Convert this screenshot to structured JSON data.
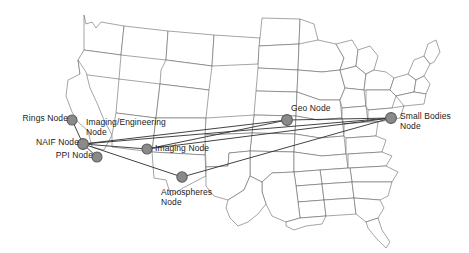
{
  "diagram": {
    "map_region": "United States",
    "line_color": "#2e2e2e",
    "node_fill": "#8a8a8a",
    "node_stroke": "#5d5d5d",
    "state_stroke": "#5a5a5a",
    "background": "#ffffff"
  },
  "nodes": [
    {
      "id": "rings",
      "label": "Rings Node",
      "label_line1": "Rings Node",
      "label_line2": "",
      "x": 72,
      "y": 120,
      "r": 5.0,
      "label_x": 14,
      "label_y": 114,
      "align": "right",
      "label_w": 54
    },
    {
      "id": "naif",
      "label": "NAIF Node",
      "label_line1": "NAIF Node",
      "label_line2": "",
      "x": 83,
      "y": 144,
      "r": 5.4,
      "label_x": 27,
      "label_y": 138,
      "align": "right",
      "label_w": 52
    },
    {
      "id": "ppi",
      "label": "PPI Node",
      "label_line1": "PPI Node",
      "label_line2": "",
      "x": 97,
      "y": 157,
      "r": 5.0,
      "label_x": 47,
      "label_y": 151,
      "align": "right",
      "label_w": 46
    },
    {
      "id": "imgeng",
      "label": "Imaging/Engineering Node",
      "label_line1": "Imaging/Engineering",
      "label_line2": "Node",
      "x": 83,
      "y": 144,
      "r": 0.0,
      "label_x": 86,
      "label_y": 118,
      "align": "left",
      "label_w": 88
    },
    {
      "id": "imaging",
      "label": "Imaging Node",
      "label_line1": "Imaging Node",
      "label_line2": "",
      "x": 147,
      "y": 149,
      "r": 5.0,
      "label_x": 155,
      "label_y": 144,
      "align": "left",
      "label_w": 62
    },
    {
      "id": "atmos",
      "label": "Atmospheres Node",
      "label_line1": "Atmospheres",
      "label_line2": "Node",
      "x": 182,
      "y": 177,
      "r": 5.2,
      "label_x": 161,
      "label_y": 188,
      "align": "left",
      "label_w": 60
    },
    {
      "id": "geo",
      "label": "Geo Node",
      "label_line1": "Geo Node",
      "label_line2": "",
      "x": 287,
      "y": 120,
      "r": 5.4,
      "label_x": 291,
      "label_y": 104,
      "align": "left",
      "label_w": 46
    },
    {
      "id": "smbodies",
      "label": "Small Bodies Node",
      "label_line1": "Small Bodies",
      "label_line2": "Node",
      "x": 391,
      "y": 118,
      "r": 5.4,
      "label_x": 400,
      "label_y": 112,
      "align": "left",
      "label_w": 60
    }
  ],
  "links": [
    {
      "from": "naif",
      "to": "rings"
    },
    {
      "from": "naif",
      "to": "ppi"
    },
    {
      "from": "naif",
      "to": "imaging"
    },
    {
      "from": "naif",
      "to": "atmos"
    },
    {
      "from": "naif",
      "to": "geo"
    },
    {
      "from": "naif",
      "to": "smbodies"
    },
    {
      "from": "imaging",
      "to": "geo"
    },
    {
      "from": "imaging",
      "to": "smbodies"
    },
    {
      "from": "geo",
      "to": "smbodies"
    },
    {
      "from": "atmos",
      "to": "smbodies"
    }
  ]
}
